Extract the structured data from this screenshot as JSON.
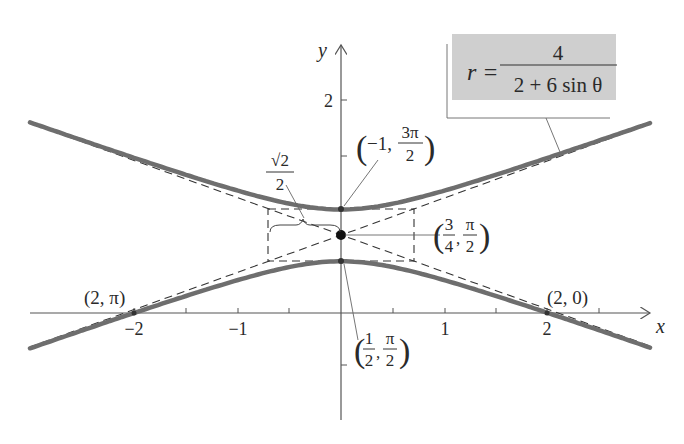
{
  "figure": {
    "equation": {
      "lhs": "r =",
      "numerator": "4",
      "denominator": "2 + 6 sin θ",
      "box_color": "#cfcfcf"
    },
    "axes": {
      "x_label": "x",
      "y_label": "y",
      "x_ticks": [
        "−2",
        "−1",
        "1",
        "2"
      ],
      "y_ticks": [
        "2"
      ]
    },
    "annotations": {
      "point_2_pi": "(2, π)",
      "point_2_0": "(2, 0)",
      "vertex_upper": {
        "open": "(",
        "a": "−1, ",
        "num": "3π",
        "den": "2",
        "close": ")"
      },
      "center": {
        "open": "(",
        "a_num": "3",
        "a_den": "4",
        "sep": ",",
        "b_num": "π",
        "b_den": "2",
        "close": ")"
      },
      "vertex_lower": {
        "open": "(",
        "a_num": "1",
        "a_den": "2",
        "sep": ",",
        "b_num": "π",
        "b_den": "2",
        "close": ")"
      },
      "conjugate_half": {
        "num": "√2",
        "den": "2"
      }
    },
    "colors": {
      "curve": "#6e6e6e",
      "dash": "#333333",
      "axis": "#555555",
      "text": "#2a2a2a"
    }
  },
  "chart_data": {
    "type": "line",
    "xlabel": "x",
    "ylabel": "y",
    "xlim": [
      -3.0,
      3.2
    ],
    "ylim": [
      -1.1,
      2.6
    ],
    "curve": "hyperbola (y - 0.75)^2/0.0625 - x^2/0.5 = 1",
    "center": [
      0,
      0.75
    ],
    "vertices": [
      [
        0,
        0.5
      ],
      [
        0,
        1.0
      ]
    ],
    "asymptotes": [
      "y = 0.75 + 0.3536 x",
      "y = 0.75 - 0.3536 x"
    ],
    "points": [
      {
        "label": "(2, π)",
        "x": -2,
        "y": 0
      },
      {
        "label": "(2, 0)",
        "x": 2,
        "y": 0
      },
      {
        "label": "(-1, 3π/2)",
        "x": 0,
        "y": 1
      },
      {
        "label": "(1/2, π/2)",
        "x": 0,
        "y": 0.5
      },
      {
        "label": "(3/4, π/2)",
        "x": 0,
        "y": 0.75
      }
    ],
    "grid": false
  }
}
